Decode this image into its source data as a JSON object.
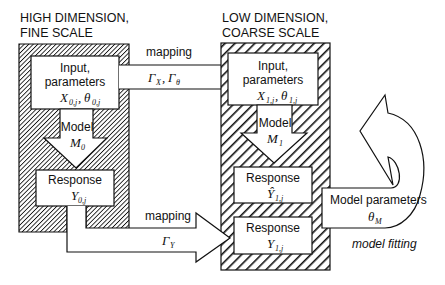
{
  "diagram": {
    "left_panel": {
      "title_line1": "HIGH DIMENSION,",
      "title_line2": "FINE SCALE",
      "pattern": "dense-hatch",
      "input_box": {
        "line1": "Input,",
        "line2": "parameters",
        "math": "X",
        "math_sub": "0,j",
        "sep": ",",
        "math2": "θ",
        "math2_sub": "0,j"
      },
      "model_arrow": {
        "label": "Model",
        "math": "M",
        "math_sub": "0"
      },
      "response_box": {
        "label": "Response",
        "math": "Y",
        "math_sub": "0,j"
      }
    },
    "right_panel": {
      "title_line1": "LOW DIMENSION,",
      "title_line2": "COARSE SCALE",
      "pattern": "wide-hatch",
      "input_box": {
        "line1": "Input,",
        "line2": "parameters",
        "math": "X",
        "math_sub": "1,j",
        "sep": ",",
        "math2": "θ",
        "math2_sub": "1,j"
      },
      "model_arrow": {
        "label": "Model",
        "math": "M",
        "math_sub": "1"
      },
      "predicted_response_box": {
        "label": "Response",
        "math": "Ŷ",
        "math_sub": "1,j"
      },
      "response_box": {
        "label": "Response",
        "math": "Y",
        "math_sub": "1,j"
      }
    },
    "mapping_top": {
      "label": "mapping",
      "math": "Γ",
      "math_sub": "X",
      "sep": ",",
      "math2": "Γ",
      "math2_sub": "θ"
    },
    "mapping_bottom": {
      "label": "mapping",
      "math": "Γ",
      "math_sub": "Y"
    },
    "model_parameters": {
      "label": "Model parameters",
      "math": "θ",
      "math_sub": "M"
    },
    "model_fitting": {
      "label": "model fitting"
    },
    "colors": {
      "stroke": "#111111",
      "fill": "#ffffff"
    }
  }
}
